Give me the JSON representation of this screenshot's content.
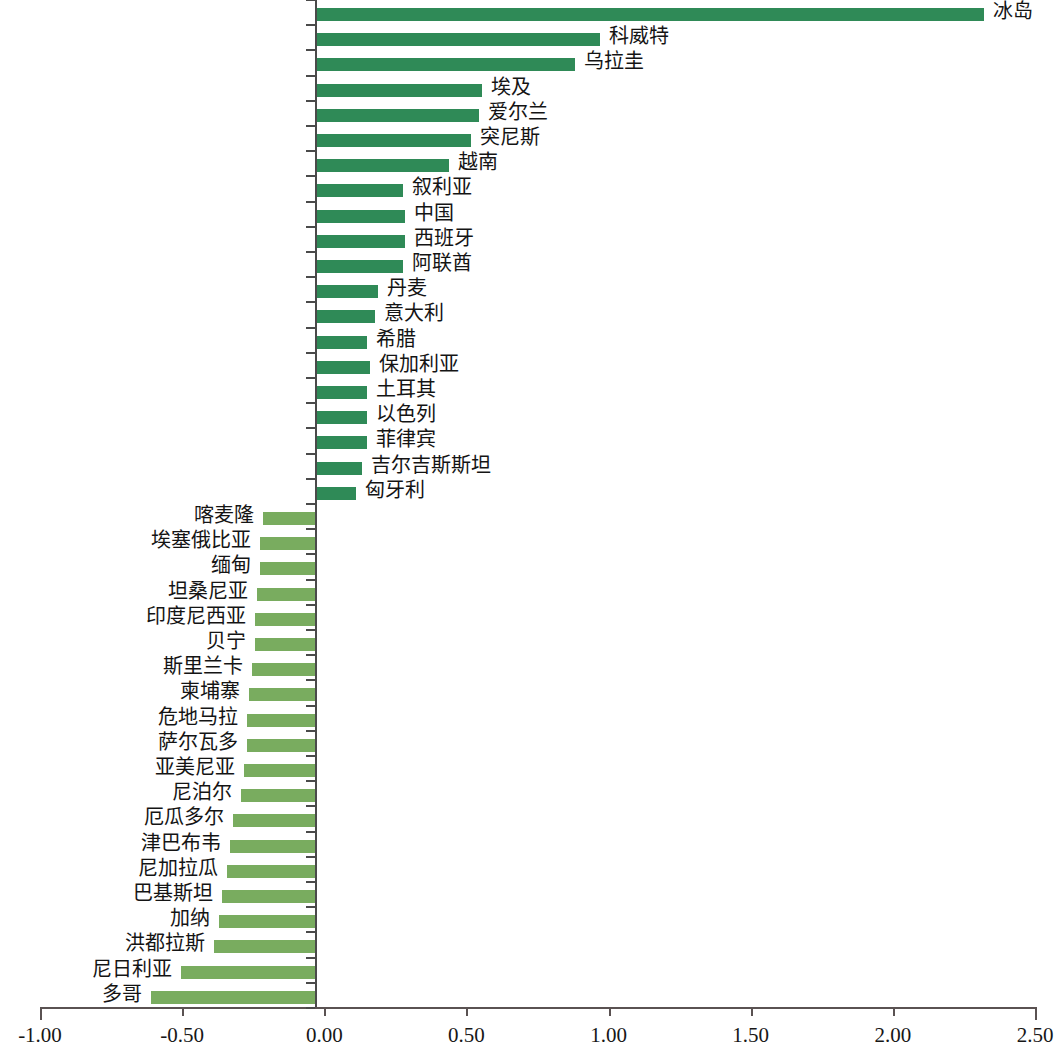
{
  "chart_data": {
    "type": "bar",
    "orientation": "horizontal",
    "title": "",
    "subtitle": "",
    "xlabel": "",
    "ylabel": "",
    "xlim": [
      -1.0,
      2.5
    ],
    "xticks": [
      -1.0,
      -0.5,
      0.0,
      0.5,
      1.0,
      1.5,
      2.0,
      2.5
    ],
    "xtick_labels": [
      "-1.00",
      "-0.50",
      "0.00",
      "0.50",
      "1.00",
      "1.50",
      "2.00",
      "2.50"
    ],
    "grid": false,
    "legend": null,
    "annotations": [],
    "colors": {
      "positive_bar": "#2f8a57",
      "negative_bar": "#79ac5f",
      "axis": "#4a4a4a",
      "text": "#141414",
      "background": "#ffffff"
    },
    "categories": [
      "冰岛",
      "科威特",
      "乌拉圭",
      "埃及",
      "爱尔兰",
      "突尼斯",
      "越南",
      "叙利亚",
      "中国",
      "西班牙",
      "阿联酋",
      "丹麦",
      "意大利",
      "希腊",
      "保加利亚",
      "土耳其",
      "以色列",
      "菲律宾",
      "吉尔吉斯斯坦",
      "匈牙利",
      "喀麦隆",
      "埃塞俄比亚",
      "缅甸",
      "坦桑尼亚",
      "印度尼西亚",
      "贝宁",
      "斯里兰卡",
      "柬埔寨",
      "危地马拉",
      "萨尔瓦多",
      "亚美尼亚",
      "尼泊尔",
      "厄瓜多尔",
      "津巴布韦",
      "尼加拉瓜",
      "巴基斯坦",
      "加纳",
      "洪都拉斯",
      "尼日利亚",
      "多哥"
    ],
    "values": [
      2.44,
      1.04,
      0.95,
      0.61,
      0.6,
      0.57,
      0.49,
      0.32,
      0.33,
      0.33,
      0.32,
      0.23,
      0.22,
      0.19,
      0.2,
      0.19,
      0.19,
      0.19,
      0.17,
      0.15,
      -0.19,
      -0.2,
      -0.2,
      -0.21,
      -0.22,
      -0.22,
      -0.23,
      -0.24,
      -0.25,
      -0.25,
      -0.26,
      -0.27,
      -0.3,
      -0.31,
      -0.32,
      -0.34,
      -0.35,
      -0.37,
      -0.49,
      -0.6
    ],
    "bars": [
      {
        "label": "冰岛",
        "value": 2.44,
        "sign": "positive"
      },
      {
        "label": "科威特",
        "value": 1.04,
        "sign": "positive"
      },
      {
        "label": "乌拉圭",
        "value": 0.95,
        "sign": "positive"
      },
      {
        "label": "埃及",
        "value": 0.61,
        "sign": "positive"
      },
      {
        "label": "爱尔兰",
        "value": 0.6,
        "sign": "positive"
      },
      {
        "label": "突尼斯",
        "value": 0.57,
        "sign": "positive"
      },
      {
        "label": "越南",
        "value": 0.49,
        "sign": "positive"
      },
      {
        "label": "叙利亚",
        "value": 0.32,
        "sign": "positive"
      },
      {
        "label": "中国",
        "value": 0.33,
        "sign": "positive"
      },
      {
        "label": "西班牙",
        "value": 0.33,
        "sign": "positive"
      },
      {
        "label": "阿联酋",
        "value": 0.32,
        "sign": "positive"
      },
      {
        "label": "丹麦",
        "value": 0.23,
        "sign": "positive"
      },
      {
        "label": "意大利",
        "value": 0.22,
        "sign": "positive"
      },
      {
        "label": "希腊",
        "value": 0.19,
        "sign": "positive"
      },
      {
        "label": "保加利亚",
        "value": 0.2,
        "sign": "positive"
      },
      {
        "label": "土耳其",
        "value": 0.19,
        "sign": "positive"
      },
      {
        "label": "以色列",
        "value": 0.19,
        "sign": "positive"
      },
      {
        "label": "菲律宾",
        "value": 0.19,
        "sign": "positive"
      },
      {
        "label": "吉尔吉斯斯坦",
        "value": 0.17,
        "sign": "positive"
      },
      {
        "label": "匈牙利",
        "value": 0.15,
        "sign": "positive"
      },
      {
        "label": "喀麦隆",
        "value": -0.19,
        "sign": "negative"
      },
      {
        "label": "埃塞俄比亚",
        "value": -0.2,
        "sign": "negative"
      },
      {
        "label": "缅甸",
        "value": -0.2,
        "sign": "negative"
      },
      {
        "label": "坦桑尼亚",
        "value": -0.21,
        "sign": "negative"
      },
      {
        "label": "印度尼西亚",
        "value": -0.22,
        "sign": "negative"
      },
      {
        "label": "贝宁",
        "value": -0.22,
        "sign": "negative"
      },
      {
        "label": "斯里兰卡",
        "value": -0.23,
        "sign": "negative"
      },
      {
        "label": "柬埔寨",
        "value": -0.24,
        "sign": "negative"
      },
      {
        "label": "危地马拉",
        "value": -0.25,
        "sign": "negative"
      },
      {
        "label": "萨尔瓦多",
        "value": -0.25,
        "sign": "negative"
      },
      {
        "label": "亚美尼亚",
        "value": -0.26,
        "sign": "negative"
      },
      {
        "label": "尼泊尔",
        "value": -0.27,
        "sign": "negative"
      },
      {
        "label": "厄瓜多尔",
        "value": -0.3,
        "sign": "negative"
      },
      {
        "label": "津巴布韦",
        "value": -0.31,
        "sign": "negative"
      },
      {
        "label": "尼加拉瓜",
        "value": -0.32,
        "sign": "negative"
      },
      {
        "label": "巴基斯坦",
        "value": -0.34,
        "sign": "negative"
      },
      {
        "label": "加纳",
        "value": -0.35,
        "sign": "negative"
      },
      {
        "label": "洪都拉斯",
        "value": -0.37,
        "sign": "negative"
      },
      {
        "label": "尼日利亚",
        "value": -0.49,
        "sign": "negative"
      },
      {
        "label": "多哥",
        "value": -0.6,
        "sign": "negative"
      }
    ]
  }
}
